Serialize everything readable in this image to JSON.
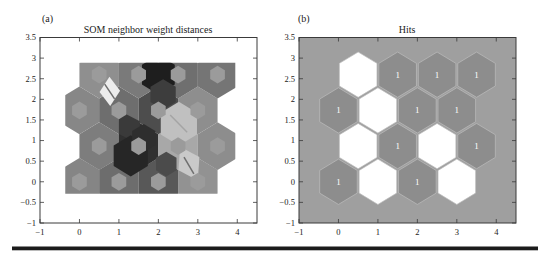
{
  "figure": {
    "background": "#ffffff",
    "divider_color": "#1b1b1b"
  },
  "chart_data": [
    {
      "type": "heatmap",
      "panel_label": "(a)",
      "title": "SOM neighbor weight distances",
      "xlabel": "",
      "ylabel": "",
      "xlim": [
        -1,
        4.5
      ],
      "ylim": [
        -1,
        3.5
      ],
      "xtick_values": [
        -1,
        0,
        1,
        2,
        3,
        4
      ],
      "xtick_labels": [
        "−1",
        "0",
        "1",
        "2",
        "3",
        "4"
      ],
      "ytick_values": [
        -1,
        -0.5,
        0,
        0.5,
        1,
        1.5,
        2,
        2.5,
        3,
        3.5
      ],
      "ytick_labels": [
        "−1",
        "−0.5",
        "0",
        "0.5",
        "1",
        "1.5",
        "2",
        "2.5",
        "3",
        "3.5"
      ],
      "grid_desc": "4x4 hexagonal SOM lattice, dark = large neighbor distance, light = small neighbor distance",
      "cell_radius": 0.578,
      "neuron_marker_radius": 0.215,
      "neuron_marker_color": "#9b9b9b",
      "clip": [
        -0.36,
        -0.289,
        3.95,
        2.887
      ],
      "cells": [
        {
          "x": 0,
          "y": 0,
          "shade": "#858585"
        },
        {
          "x": 1,
          "y": 0,
          "shade": "#6d6d6d"
        },
        {
          "x": 2,
          "y": 0,
          "shade": "#585858"
        },
        {
          "x": 3,
          "y": 0,
          "shade": "#929292"
        },
        {
          "x": 0.5,
          "y": 0.866,
          "shade": "#7d7d7d"
        },
        {
          "x": 1.5,
          "y": 0.866,
          "shade": "#303030"
        },
        {
          "x": 2.5,
          "y": 0.866,
          "shade": "#a8a8a8"
        },
        {
          "x": 3.5,
          "y": 0.866,
          "shade": "#8d8d8d"
        },
        {
          "x": 0,
          "y": 1.732,
          "shade": "#878787"
        },
        {
          "x": 1,
          "y": 1.732,
          "shade": "#6e6e6e"
        },
        {
          "x": 2,
          "y": 1.732,
          "shade": "#4d4d4d"
        },
        {
          "x": 3,
          "y": 1.732,
          "shade": "#8e8e8e"
        },
        {
          "x": 0.5,
          "y": 2.598,
          "shade": "#8f8f8f"
        },
        {
          "x": 1.5,
          "y": 2.598,
          "shade": "#7a7a7a"
        },
        {
          "x": 2.5,
          "y": 2.598,
          "shade": "#6f6f6f"
        },
        {
          "x": 3.5,
          "y": 2.598,
          "shade": "#757575"
        }
      ],
      "patches": [
        {
          "shape": "hex",
          "x": 2.0,
          "y": 2.598,
          "r": 0.48,
          "fill": "#1e1e1e"
        },
        {
          "shape": "hex",
          "x": 2.12,
          "y": 2.12,
          "r": 0.37,
          "fill": "#3d3d3d"
        },
        {
          "shape": "poly",
          "pts": [
            [
              0.76,
              2.55
            ],
            [
              1.03,
              2.21
            ],
            [
              0.78,
              1.84
            ],
            [
              0.51,
              2.18
            ]
          ],
          "fill": "#ececec",
          "line": [
            [
              0.64,
              2.37
            ],
            [
              0.89,
              2.01
            ]
          ],
          "line_color": "#6e6e6e"
        },
        {
          "shape": "hex",
          "x": 2.52,
          "y": 1.41,
          "r": 0.53,
          "fill": "#c0c0c0",
          "line": [
            [
              2.3,
              1.62
            ],
            [
              2.73,
              1.2
            ]
          ],
          "line_color": "#a4a4a4"
        },
        {
          "shape": "poly",
          "pts": [
            [
              1.0,
              1.732
            ],
            [
              1.53,
              1.47
            ],
            [
              1.53,
              0.9
            ],
            [
              1.0,
              1.16
            ]
          ],
          "fill": "#3a3a3a"
        },
        {
          "shape": "hex",
          "x": 1.3,
          "y": 0.63,
          "r": 0.5,
          "fill": "#262626"
        },
        {
          "shape": "hex",
          "x": 1.63,
          "y": 1.06,
          "r": 0.34,
          "fill": "#2e2e2e"
        },
        {
          "shape": "hex",
          "x": 2.2,
          "y": 0.43,
          "r": 0.3,
          "fill": "#4b4b4b"
        },
        {
          "shape": "poly",
          "pts": [
            [
              2.55,
              0.85
            ],
            [
              3.04,
              0.6
            ],
            [
              3.0,
              0.03
            ],
            [
              2.51,
              0.28
            ]
          ],
          "fill": "#c9c9c9",
          "line": [
            [
              2.65,
              0.6
            ],
            [
              2.9,
              0.19
            ]
          ],
          "line_color": "#6f6f6f"
        }
      ]
    },
    {
      "type": "heatmap",
      "panel_label": "(b)",
      "title": "Hits",
      "xlabel": "",
      "ylabel": "",
      "xlim": [
        -1,
        4.5
      ],
      "ylim": [
        -1,
        3.5
      ],
      "xtick_values": [
        -1,
        0,
        1,
        2,
        3,
        4
      ],
      "xtick_labels": [
        "−1",
        "0",
        "1",
        "2",
        "3",
        "4"
      ],
      "ytick_values": [
        -1,
        -0.5,
        0,
        0.5,
        1,
        1.5,
        2,
        2.5,
        3,
        3.5
      ],
      "ytick_labels": [
        "−1",
        "−0.5",
        "0",
        "0.5",
        "1",
        "1.5",
        "2",
        "2.5",
        "3",
        "3.5"
      ],
      "grid_desc": "4x4 hexagonal SOM lattice, gray hexagon with count = neuron hit, white hexagon = 0 hits",
      "background": "#9f9f9f",
      "cell_radius": 0.55,
      "hit_fill": "#8d8d8d",
      "empty_fill": "#ffffff",
      "cell_stroke": "#bdbdbd",
      "hit_label_color": "#ffffff",
      "total_hits": 10,
      "cells": [
        {
          "x": 0,
          "y": 0,
          "hits": 1
        },
        {
          "x": 1,
          "y": 0,
          "hits": 0
        },
        {
          "x": 2,
          "y": 0,
          "hits": 1
        },
        {
          "x": 3,
          "y": 0,
          "hits": 0
        },
        {
          "x": 0.5,
          "y": 0.866,
          "hits": 0
        },
        {
          "x": 1.5,
          "y": 0.866,
          "hits": 1
        },
        {
          "x": 2.5,
          "y": 0.866,
          "hits": 0
        },
        {
          "x": 3.5,
          "y": 0.866,
          "hits": 1
        },
        {
          "x": 0,
          "y": 1.732,
          "hits": 1
        },
        {
          "x": 1,
          "y": 1.732,
          "hits": 0
        },
        {
          "x": 2,
          "y": 1.732,
          "hits": 1
        },
        {
          "x": 3,
          "y": 1.732,
          "hits": 1
        },
        {
          "x": 0.5,
          "y": 2.598,
          "hits": 0
        },
        {
          "x": 1.5,
          "y": 2.598,
          "hits": 1
        },
        {
          "x": 2.5,
          "y": 2.598,
          "hits": 1
        },
        {
          "x": 3.5,
          "y": 2.598,
          "hits": 1
        }
      ]
    }
  ],
  "axis_style": {
    "box_color": "#3a3a3a",
    "tick_color": "#3a3a3a",
    "tick_label_color": "#222222"
  }
}
